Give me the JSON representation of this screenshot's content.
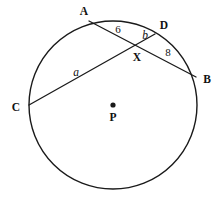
{
  "figure": {
    "type": "circle-geometry-diagram",
    "stroke_color": "#1a1a1a",
    "background_color": "#ffffff",
    "circle": {
      "center_label": "P",
      "center_x": 113,
      "center_y": 105,
      "radius": 84,
      "center_dot_radius": 2.6
    },
    "points": [
      {
        "id": "A",
        "label": "A",
        "x": 89,
        "y": 21,
        "label_x": 84,
        "label_y": 12,
        "kind": "point"
      },
      {
        "id": "D",
        "label": "D",
        "x": 155,
        "y": 34,
        "label_x": 164,
        "label_y": 26,
        "kind": "point"
      },
      {
        "id": "B",
        "label": "B",
        "x": 196,
        "y": 77,
        "label_x": 207,
        "label_y": 80,
        "kind": "point"
      },
      {
        "id": "C",
        "label": "C",
        "x": 29,
        "y": 105,
        "label_x": 16,
        "label_y": 108,
        "kind": "point"
      },
      {
        "id": "X",
        "label": "X",
        "x": 137,
        "y": 48,
        "label_x": 137,
        "label_y": 58,
        "kind": "point"
      },
      {
        "id": "P",
        "label": "P",
        "x": 113,
        "y": 105,
        "label_x": 113,
        "label_y": 118,
        "kind": "center"
      }
    ],
    "chords": [
      {
        "id": "chord-AB",
        "from": "A",
        "to": "B",
        "x1": 89,
        "y1": 21,
        "x2": 196,
        "y2": 77
      },
      {
        "id": "chord-CD",
        "from": "C",
        "to": "D",
        "x1": 29,
        "y1": 105,
        "x2": 155,
        "y2": 34
      }
    ],
    "segment_labels": [
      {
        "id": "seg-AX",
        "text": "6",
        "x": 118,
        "y": 29,
        "style": "measure"
      },
      {
        "id": "seg-XD",
        "text": "b",
        "x": 145,
        "y": 36,
        "style": "variable"
      },
      {
        "id": "seg-XB",
        "text": "8",
        "x": 168,
        "y": 52,
        "style": "measure"
      },
      {
        "id": "seg-CX",
        "text": "a",
        "x": 76,
        "y": 73,
        "style": "variable"
      }
    ]
  }
}
